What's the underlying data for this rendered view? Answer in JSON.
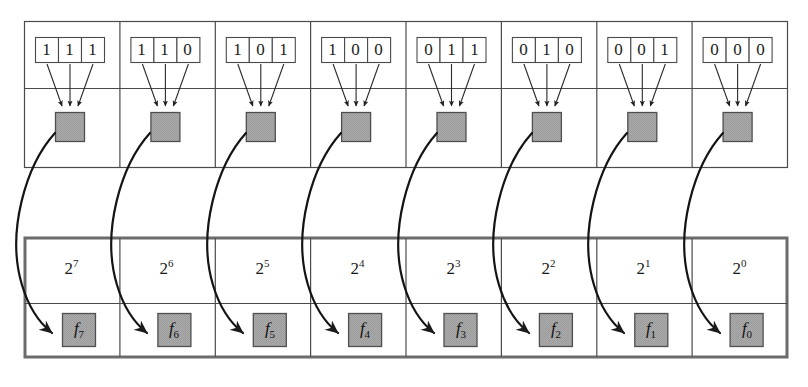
{
  "figure": {
    "colors": {
      "gray_fill": "#a8a8a8",
      "gray_stroke": "#555555",
      "line": "#4a4a4a",
      "thick_border": "#666666",
      "text": "#1a1a1a"
    }
  },
  "top_row": {
    "name": "binary-code-row",
    "cells": [
      {
        "bits": [
          "1",
          "1",
          "1"
        ],
        "node": "gray-node"
      },
      {
        "bits": [
          "1",
          "1",
          "0"
        ],
        "node": "gray-node"
      },
      {
        "bits": [
          "1",
          "0",
          "1"
        ],
        "node": "gray-node"
      },
      {
        "bits": [
          "1",
          "0",
          "0"
        ],
        "node": "gray-node"
      },
      {
        "bits": [
          "0",
          "1",
          "1"
        ],
        "node": "gray-node"
      },
      {
        "bits": [
          "0",
          "1",
          "0"
        ],
        "node": "gray-node"
      },
      {
        "bits": [
          "0",
          "0",
          "1"
        ],
        "node": "gray-node"
      },
      {
        "bits": [
          "0",
          "0",
          "0"
        ],
        "node": "gray-node"
      }
    ]
  },
  "bottom_row": {
    "name": "power-of-two-row",
    "cells": [
      {
        "base": "2",
        "exponent": "7",
        "label_base": "f",
        "label_sub": "7"
      },
      {
        "base": "2",
        "exponent": "6",
        "label_base": "f",
        "label_sub": "6"
      },
      {
        "base": "2",
        "exponent": "5",
        "label_base": "f",
        "label_sub": "5"
      },
      {
        "base": "2",
        "exponent": "4",
        "label_base": "f",
        "label_sub": "4"
      },
      {
        "base": "2",
        "exponent": "3",
        "label_base": "f",
        "label_sub": "3"
      },
      {
        "base": "2",
        "exponent": "2",
        "label_base": "f",
        "label_sub": "2"
      },
      {
        "base": "2",
        "exponent": "1",
        "label_base": "f",
        "label_sub": "1"
      },
      {
        "base": "2",
        "exponent": "0",
        "label_base": "f",
        "label_sub": "0"
      }
    ]
  },
  "caption": {
    "text": ""
  }
}
